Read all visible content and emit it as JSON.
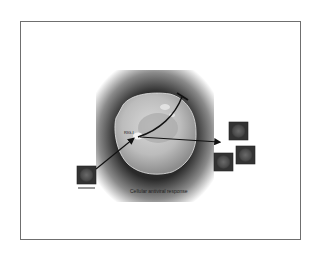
{
  "figure": {
    "caption": "Cellular antiviral response",
    "protein_label": "RIG-I",
    "source_virion_label": "Virus particle",
    "virion_count_out": 3,
    "icons": {
      "cell": "cell-icon",
      "virion": "virion-icon",
      "activation_arrow": "arrow-icon",
      "inhibition": "t-bar-inhibition-icon"
    }
  }
}
